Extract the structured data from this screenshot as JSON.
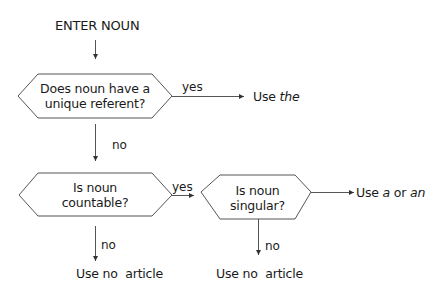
{
  "diagram": {
    "start": "ENTER NOUN",
    "decisions": [
      {
        "id": "unique",
        "line1": "Does noun have a",
        "line2": "unique referent?"
      },
      {
        "id": "countable",
        "line1": "Is noun",
        "line2": "countable?"
      },
      {
        "id": "singular",
        "line1": "Is noun",
        "line2": "singular?"
      }
    ],
    "edge_labels": {
      "unique_yes": "yes",
      "unique_no": "no",
      "countable_yes": "yes",
      "countable_no": "no",
      "singular_no": "no"
    },
    "outcomes": {
      "use_the": {
        "prefix": "Use ",
        "italic": "the"
      },
      "use_a_an": {
        "prefix": "Use ",
        "italic1": "a",
        "middle": " or ",
        "italic2": "an"
      },
      "no_article_1": "Use no  article",
      "no_article_2": "Use no  article"
    },
    "colors": {
      "stroke": "#4a4a4a",
      "text": "#1a1a1a"
    }
  }
}
